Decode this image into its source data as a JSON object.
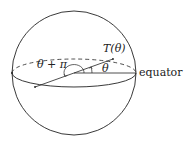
{
  "diagram": {
    "labels": {
      "point": "T(θ)",
      "angle": "θ",
      "opposite_angle": "θ + π",
      "equator": "equator"
    },
    "colors": {
      "stroke": "#222222",
      "background": "#ffffff"
    }
  }
}
